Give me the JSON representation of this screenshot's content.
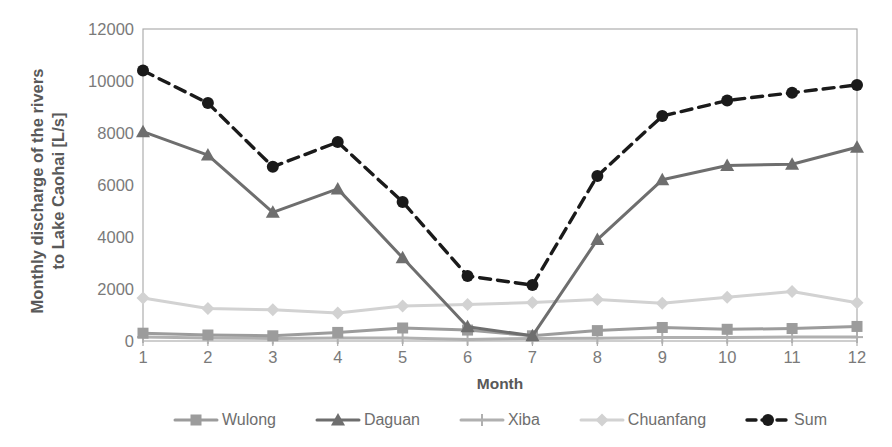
{
  "chart_data": {
    "type": "line",
    "title": "",
    "xlabel": "Month",
    "ylabel": "Monthly discharge of the rivers\nto Lake Caohai [L/s]",
    "categories": [
      "1",
      "2",
      "3",
      "4",
      "5",
      "6",
      "7",
      "8",
      "9",
      "10",
      "11",
      "12"
    ],
    "x": [
      1,
      2,
      3,
      4,
      5,
      6,
      7,
      8,
      9,
      10,
      11,
      12
    ],
    "xlim": [
      1,
      12
    ],
    "ylim": [
      0,
      12000
    ],
    "yticks": [
      0,
      2000,
      4000,
      6000,
      8000,
      10000,
      12000
    ],
    "ytick_labels": [
      "0",
      "2000",
      "4000",
      "6000",
      "8000",
      "10000",
      "12000"
    ],
    "grid": false,
    "legend_position": "bottom",
    "series": [
      {
        "name": "Wulong",
        "marker": "square",
        "color": "#9c9c9c",
        "dashed": false,
        "values": [
          300,
          230,
          200,
          330,
          500,
          420,
          200,
          400,
          520,
          450,
          480,
          560
        ]
      },
      {
        "name": "Daguan",
        "marker": "triangle",
        "color": "#6e6e6e",
        "dashed": false,
        "values": [
          8050,
          7150,
          4950,
          5850,
          3200,
          550,
          200,
          3900,
          6200,
          6750,
          6800,
          7450
        ]
      },
      {
        "name": "Xiba",
        "marker": "plus",
        "color": "#b0b0b0",
        "dashed": false,
        "values": [
          150,
          120,
          100,
          120,
          120,
          60,
          100,
          110,
          130,
          130,
          150,
          150
        ]
      },
      {
        "name": "Chuanfang",
        "marker": "diamond",
        "color": "#d2d2d2",
        "dashed": false,
        "values": [
          1650,
          1250,
          1200,
          1080,
          1350,
          1400,
          1480,
          1600,
          1450,
          1680,
          1900,
          1470
        ]
      },
      {
        "name": "Sum",
        "marker": "circle",
        "color": "#1a1a1a",
        "dashed": true,
        "values": [
          10400,
          9150,
          6700,
          7650,
          5350,
          2500,
          2150,
          6350,
          8650,
          9250,
          9550,
          9850
        ]
      }
    ]
  },
  "axes": {
    "plot_left": 143,
    "plot_right": 857,
    "plot_top": 29,
    "plot_bottom": 341,
    "frame_color": "#a6a6a6"
  }
}
